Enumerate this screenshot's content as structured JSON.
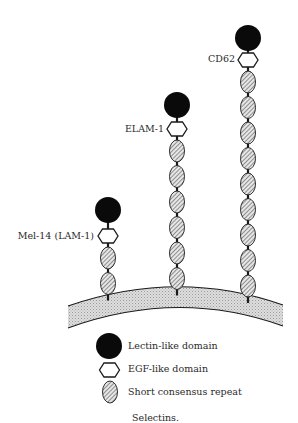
{
  "figure": {
    "caption": "Selectins.",
    "colors": {
      "lectin": "#0a0a0a",
      "egf_fill": "#ffffff",
      "stroke": "#1a1a1a",
      "scr_fill": "#c8c8c8",
      "membrane_fill": "#d9d9d9"
    },
    "molecules": [
      {
        "name": "Mel-14 (LAM-1)",
        "cx": 108,
        "lectin_cy": 210,
        "egf_cy": 236,
        "scr_count": 2,
        "scr_start": 258,
        "label_x": 94,
        "label_y": 239
      },
      {
        "name": "ELAM-1",
        "cx": 177,
        "lectin_cy": 105,
        "egf_cy": 129,
        "scr_count": 6,
        "scr_start": 151,
        "label_x": 164,
        "label_y": 132
      },
      {
        "name": "CD62",
        "cx": 248,
        "lectin_cy": 38,
        "egf_cy": 60,
        "scr_count": 9,
        "scr_start": 82,
        "label_x": 235,
        "label_y": 62
      }
    ],
    "legend": [
      {
        "symbol": "lectin",
        "label": "Lectin-like domain"
      },
      {
        "symbol": "egf",
        "label": "EGF-like domain"
      },
      {
        "symbol": "scr",
        "label": "Short consensus repeat"
      }
    ]
  }
}
